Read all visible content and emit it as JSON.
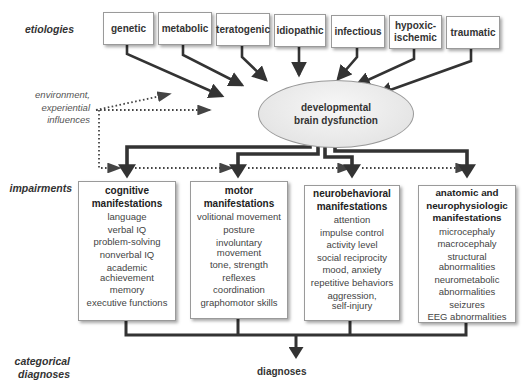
{
  "row_labels": {
    "etiologies": "etiologies",
    "impairments": "impairments",
    "categorical_line1": "categorical",
    "categorical_line2": "diagnoses"
  },
  "influence_note": {
    "line1": "environment,",
    "line2": "experiential",
    "line3": "influences"
  },
  "etiologies": [
    {
      "label": "genetic"
    },
    {
      "label": "metabolic"
    },
    {
      "label": "teratogenic"
    },
    {
      "label": "idiopathic"
    },
    {
      "label": "infectious"
    },
    {
      "label": "hypoxic-",
      "label2": "ischemic"
    },
    {
      "label": "traumatic"
    }
  ],
  "center": {
    "line1": "developmental",
    "line2": "brain dysfunction"
  },
  "impairments": [
    {
      "title1": "cognitive",
      "title2": "manifestations",
      "items": [
        "language",
        "verbal IQ",
        "problem-solving",
        "nonverbal IQ",
        "academic achievement",
        "memory",
        "executive functions"
      ]
    },
    {
      "title1": "motor",
      "title2": "manifestations",
      "items": [
        "volitional movement",
        "posture",
        "involuntary movement",
        "tone, strength",
        "reflexes",
        "coordination",
        "graphomotor skills"
      ]
    },
    {
      "title1": "neurobehavioral",
      "title2": "manifestations",
      "items": [
        "attention",
        "impulse control",
        "activity level",
        "social reciprocity",
        "mood, anxiety",
        "repetitive behaviors",
        "aggression, self-injury"
      ]
    },
    {
      "title1": "anatomic and",
      "title2": "neurophysiologic",
      "title3": "manifestations",
      "items": [
        "microcephaly",
        "macrocephaly",
        "structural abnormalities",
        "neurometabolic",
        "abnormalities",
        "seizures",
        "EEG abnormalities"
      ]
    }
  ],
  "outcome": "diagnoses",
  "colors": {
    "arrow": "#333333",
    "dotted": "#444444",
    "box_border": "#9a9a9a",
    "ellipse_fill": "#e6e6e6"
  }
}
